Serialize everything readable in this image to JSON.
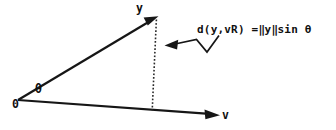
{
  "figure": {
    "kind": "vector-distance-diagram",
    "background_color": "#ffffff",
    "ink_color": "#161616",
    "labels": {
      "vector_y": "y",
      "vector_v": "v",
      "origin": "0",
      "angle": "θ"
    },
    "annotation": {
      "full_text": "d(y,vR) = ‖y‖sin θ",
      "function_part": "d(y,vR)",
      "equals": "=",
      "norm_open": "‖",
      "norm_arg": "y",
      "norm_close": "‖",
      "trig_part": "sin",
      "angle_symbol": "θ"
    },
    "geometry": {
      "origin_point": [
        18,
        100
      ],
      "y_tip_point": [
        157,
        17
      ],
      "v_tip_point": [
        219,
        115
      ],
      "foot_point": [
        152,
        110
      ],
      "dashed_segment_label": "perpendicular distance from y to span(v)",
      "leader_points": "218,36 207,52 196,40 166,45"
    }
  }
}
